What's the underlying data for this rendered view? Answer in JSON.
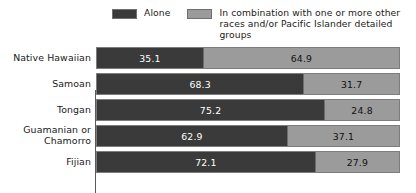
{
  "legend": {
    "entries": [
      {
        "label": "Alone",
        "color": "#3a3a3a",
        "swatch_name": "legend-swatch-alone"
      },
      {
        "label": "In combination with one or more other\nraces and/or Pacific Islander detailed groups",
        "color": "#9b9b9b",
        "swatch_name": "legend-swatch-combination"
      }
    ]
  },
  "chart_data": {
    "type": "bar",
    "orientation": "horizontal",
    "stacked": true,
    "stack_total": 100,
    "title": "",
    "subtitle": "",
    "xlabel": "",
    "ylabel": "",
    "xlim": [
      0,
      100
    ],
    "grid": false,
    "legend_position": "top",
    "value_suffix": "",
    "categories": [
      "Native Hawaiian",
      "Samoan",
      "Tongan",
      "Guamanian or\nChamorro",
      "Fijian"
    ],
    "series": [
      {
        "name": "Alone",
        "color": "#3a3a3a",
        "values": [
          35.1,
          68.3,
          75.2,
          62.9,
          72.1
        ],
        "labels": [
          "35.1",
          "68.3",
          "75.2",
          "62.9",
          "72.1"
        ]
      },
      {
        "name": "In combination with one or more other races and/or Pacific Islander detailed groups",
        "color": "#9b9b9b",
        "values": [
          64.9,
          31.7,
          24.8,
          37.1,
          27.9
        ],
        "labels": [
          "64.9",
          "31.7",
          "24.8",
          "37.1",
          "27.9"
        ]
      }
    ]
  },
  "colors": {
    "alone": "#3a3a3a",
    "combination": "#9b9b9b",
    "background": "#ffffff",
    "text": "#1a1a1a",
    "bar_outline": "#7d7d7d"
  }
}
